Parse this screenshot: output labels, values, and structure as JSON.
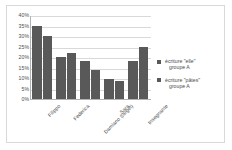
{
  "chart_data": {
    "type": "bar",
    "title": "",
    "xlabel": "",
    "ylabel": "",
    "ylim": [
      0,
      40
    ],
    "ytick_labels": [
      "40%",
      "35%",
      "30%",
      "25%",
      "20%",
      "15%",
      "10%",
      "5%",
      "0%"
    ],
    "ytick_values": [
      40,
      35,
      30,
      25,
      20,
      15,
      10,
      5,
      0
    ],
    "grid": true,
    "legend_position": "right",
    "categories": [
      "Filippo",
      "Federica",
      "Damiano (target)",
      "Sara",
      "Insegnante"
    ],
    "series": [
      {
        "name": "écriture \"elle\" groupe A",
        "legend_line1": "écriture \"elle\"",
        "legend_line2": "groupe A",
        "color": "#595959",
        "values": [
          35,
          20,
          18,
          9.5,
          18
        ]
      },
      {
        "name": "écriture \"pâtes\" groupe A",
        "legend_line1": "écriture \"pâtes\"",
        "legend_line2": "groupe A",
        "color": "#595959",
        "values": [
          30,
          22,
          14,
          8.5,
          25
        ]
      }
    ]
  }
}
